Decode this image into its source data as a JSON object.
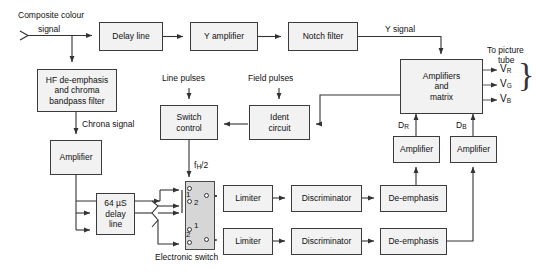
{
  "diagram": {
    "canvas": {
      "width": 536,
      "height": 279
    },
    "colors": {
      "box_fill": "#f2f2f2",
      "box_stroke": "#3b3b3b",
      "switch_fill": "#d6d6d6",
      "line": "#333333",
      "background": "#ffffff",
      "text": "#111111"
    }
  },
  "blocks": {
    "delay_line": "Delay line",
    "y_amplifier": "Y amplifier",
    "notch_filter": "Notch filter",
    "hf_deemphasis": {
      "line1": "HF de-emphasis",
      "line2": "and chroma",
      "line3": "bandpass filter"
    },
    "amplifier_chroma": "Amplifier",
    "delay_64us": {
      "line1": "64 µS",
      "line2": "delay",
      "line3": "line"
    },
    "switch_control": {
      "line1": "Switch",
      "line2": "control"
    },
    "ident_circuit": {
      "line1": "Ident",
      "line2": "circuit"
    },
    "amplifiers_matrix": {
      "line1": "Amplifiers",
      "line2": "and",
      "line3": "matrix"
    },
    "limiter_top": "Limiter",
    "limiter_bottom": "Limiter",
    "discriminator_top": "Discriminator",
    "discriminator_bottom": "Discriminator",
    "deemphasis_top": "De-emphasis",
    "deemphasis_bottom": "De-emphasis",
    "amplifier_dr": "Amplifier",
    "amplifier_db": "Amplifier"
  },
  "labels": {
    "composite_input_line1": "Composite colour",
    "composite_input_line2": "signal",
    "y_signal": "Y signal",
    "chroma_signal": "Chrona signal",
    "line_pulses": "Line pulses",
    "field_pulses": "Field pulses",
    "fh_half_prefix": "f",
    "fh_half_sub": "H",
    "fh_half_suffix": "/2",
    "electronic_switch": "Electronic switch",
    "to_picture_tube_line1": "To picture",
    "to_picture_tube_line2": "tube",
    "dr_prefix": "D",
    "dr_sub": "R",
    "db_prefix": "D",
    "db_sub": "B",
    "vr_prefix": "V",
    "vr_sub": "R",
    "vg_prefix": "V",
    "vg_sub": "G",
    "vb_prefix": "V",
    "vb_sub": "B",
    "switch_pos_1a": "1",
    "switch_pos_2a": "2",
    "switch_pos_1b": "1",
    "switch_pos_2b": "2"
  }
}
